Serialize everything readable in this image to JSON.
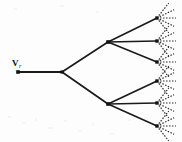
{
  "figure": {
    "name": "ternary-tree-diagram",
    "type": "tree-diagram",
    "width": 182,
    "height": 142,
    "background_color": "#fdfdfd",
    "line_color": "#1a1a1a",
    "node_color": "#111111",
    "dash_color": "#2a2a2a"
  },
  "labels": {
    "root_label_base": "V",
    "root_label_subscript": "r",
    "root_label_full": "Vr"
  },
  "nodes": [
    {
      "id": "root",
      "name": "root-node",
      "x": 18,
      "y": 72,
      "shape": "square",
      "size": 3.6,
      "label": "Vr"
    },
    {
      "id": "split",
      "name": "first-split-node",
      "x": 62,
      "y": 72,
      "shape": "square",
      "size": 3.2,
      "label": ""
    },
    {
      "id": "internal-upper",
      "name": "internal-node-upper",
      "x": 108,
      "y": 42,
      "shape": "square",
      "size": 3.6,
      "label": ""
    },
    {
      "id": "internal-lower",
      "name": "internal-node-lower",
      "x": 108,
      "y": 104,
      "shape": "square",
      "size": 3.6,
      "label": ""
    },
    {
      "id": "leaf-1",
      "name": "leaf-node-1",
      "x": 157,
      "y": 18,
      "shape": "square",
      "size": 3.4,
      "label": ""
    },
    {
      "id": "leaf-2",
      "name": "leaf-node-2",
      "x": 157,
      "y": 41,
      "shape": "square",
      "size": 3.4,
      "label": ""
    },
    {
      "id": "leaf-3",
      "name": "leaf-node-3",
      "x": 157,
      "y": 62,
      "shape": "square",
      "size": 3.4,
      "label": ""
    },
    {
      "id": "leaf-4",
      "name": "leaf-node-4",
      "x": 157,
      "y": 81,
      "shape": "square",
      "size": 3.4,
      "label": ""
    },
    {
      "id": "leaf-5",
      "name": "leaf-node-5",
      "x": 157,
      "y": 103,
      "shape": "square",
      "size": 3.4,
      "label": ""
    },
    {
      "id": "leaf-6",
      "name": "leaf-node-6",
      "x": 157,
      "y": 126,
      "shape": "square",
      "size": 3.4,
      "label": ""
    }
  ],
  "edges": [
    {
      "name": "edge-root-stem",
      "from": "root",
      "to": "split",
      "x1": 18,
      "y1": 72,
      "x2": 62,
      "y2": 72,
      "style": "solid",
      "width": 2.0
    },
    {
      "name": "edge-split-upper",
      "from": "split",
      "to": "internal-upper",
      "x1": 62,
      "y1": 72,
      "x2": 108,
      "y2": 42,
      "style": "solid",
      "width": 1.6
    },
    {
      "name": "edge-split-lower",
      "from": "split",
      "to": "internal-lower",
      "x1": 62,
      "y1": 72,
      "x2": 108,
      "y2": 104,
      "style": "solid",
      "width": 1.6
    },
    {
      "name": "edge-upper-leaf1",
      "from": "internal-upper",
      "to": "leaf-1",
      "x1": 108,
      "y1": 42,
      "x2": 157,
      "y2": 18,
      "style": "solid",
      "width": 1.6
    },
    {
      "name": "edge-upper-leaf2",
      "from": "internal-upper",
      "to": "leaf-2",
      "x1": 108,
      "y1": 42,
      "x2": 157,
      "y2": 41,
      "style": "solid",
      "width": 1.6
    },
    {
      "name": "edge-upper-leaf3",
      "from": "internal-upper",
      "to": "leaf-3",
      "x1": 108,
      "y1": 42,
      "x2": 157,
      "y2": 62,
      "style": "solid",
      "width": 1.6
    },
    {
      "name": "edge-lower-leaf4",
      "from": "internal-lower",
      "to": "leaf-4",
      "x1": 108,
      "y1": 104,
      "x2": 157,
      "y2": 81,
      "style": "solid",
      "width": 1.6
    },
    {
      "name": "edge-lower-leaf5",
      "from": "internal-lower",
      "to": "leaf-5",
      "x1": 108,
      "y1": 104,
      "x2": 157,
      "y2": 103,
      "style": "solid",
      "width": 1.6
    },
    {
      "name": "edge-lower-leaf6",
      "from": "internal-lower",
      "to": "leaf-6",
      "x1": 108,
      "y1": 104,
      "x2": 157,
      "y2": 126,
      "style": "solid",
      "width": 1.6
    }
  ],
  "leaf_fans": {
    "description": "dashed rays fanning rightward from each leaf node",
    "rays_per_leaf": 5,
    "ray_length": 19,
    "angles_deg": [
      -52,
      -26,
      0,
      26,
      52
    ],
    "style": "dashed"
  }
}
